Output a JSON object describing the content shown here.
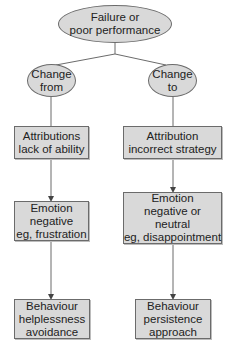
{
  "diagram": {
    "root": {
      "lines": [
        "Failure or",
        "poor performance"
      ]
    },
    "branches": [
      {
        "change": {
          "lines": [
            "Change",
            "from"
          ]
        },
        "attribution": {
          "lines": [
            "Attributions",
            "lack of ability"
          ]
        },
        "emotion": {
          "lines": [
            "Emotion",
            "negative",
            "eg, frustration"
          ]
        },
        "behaviour": {
          "lines": [
            "Behaviour",
            "helplessness",
            "avoidance"
          ]
        }
      },
      {
        "change": {
          "lines": [
            "Change",
            "to"
          ]
        },
        "attribution": {
          "lines": [
            "Attribution",
            "incorrect strategy"
          ]
        },
        "emotion": {
          "lines": [
            "Emotion",
            "negative or",
            "neutral",
            "eg, disappointment"
          ]
        },
        "behaviour": {
          "lines": [
            "Behaviour",
            "persistence",
            "approach"
          ]
        }
      }
    ],
    "colors": {
      "node_fill": "#d9d9d9",
      "stroke": "#6b6b6b",
      "text": "#222222"
    }
  }
}
